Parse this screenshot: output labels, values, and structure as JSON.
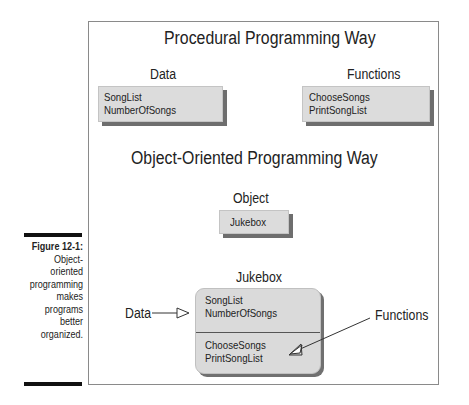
{
  "caption": {
    "number": "Figure 12-1:",
    "lines": [
      "Object-",
      "oriented",
      "programming",
      "makes",
      "programs",
      "better",
      "organized."
    ]
  },
  "procedural": {
    "title": "Procedural Programming Way",
    "data_label": "Data",
    "data_items": [
      "SongList",
      "NumberOfSongs"
    ],
    "functions_label": "Functions",
    "function_items": [
      "ChooseSongs",
      "PrintSongList"
    ]
  },
  "object_oriented": {
    "title": "Object-Oriented Programming Way",
    "object_label": "Object",
    "object_name": "Jukebox",
    "class_title": "Jukebox",
    "class_data_items": [
      "SongList",
      "NumberOfSongs"
    ],
    "class_function_items": [
      "ChooseSongs",
      "PrintSongList"
    ],
    "data_pointer_label": "Data",
    "functions_pointer_label": "Functions"
  },
  "colors": {
    "box_fill": "#dcdcdc",
    "box_shadow": "#6e6e6e",
    "frame_border": "#8a8a8a",
    "caption_bar": "#111111"
  }
}
